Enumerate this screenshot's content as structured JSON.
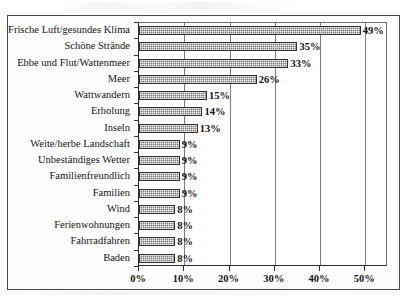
{
  "chart_data": {
    "type": "bar",
    "orientation": "horizontal",
    "title": "",
    "subtitle": "",
    "xlabel": "",
    "ylabel": "",
    "xlim": [
      0,
      55
    ],
    "grid": true,
    "legend": null,
    "xticks": [
      "0%",
      "10%",
      "20%",
      "30%",
      "40%",
      "50%"
    ],
    "xtick_values": [
      0,
      10,
      20,
      30,
      40,
      50
    ],
    "categories": [
      "Frische Luft/gesundes Klima",
      "Schöne Strände",
      "Ebbe und Flut/Wattenmeer",
      "Meer",
      "Wattwandern",
      "Erholung",
      "Inseln",
      "Weite/herbe Landschaft",
      "Unbeständiges Wetter",
      "Familienfreundlich",
      "Familien",
      "Wind",
      "Ferienwohnungen",
      "Fahrradfahren",
      "Baden"
    ],
    "values": [
      49,
      35,
      33,
      26,
      15,
      14,
      13,
      9,
      9,
      9,
      9,
      8,
      8,
      8,
      8
    ],
    "value_labels": [
      "49%",
      "35%",
      "33%",
      "26%",
      "15%",
      "14%",
      "13%",
      "9%",
      "9%",
      "9%",
      "9%",
      "8%",
      "8%",
      "8%",
      "8%"
    ],
    "bar_fill_color": "#9b9b9b",
    "bar_border_color": "#2f2f2f",
    "gridline_color": "#7d7d7d",
    "axis_color": "#2b2b2b",
    "background_color": "#ffffff"
  }
}
